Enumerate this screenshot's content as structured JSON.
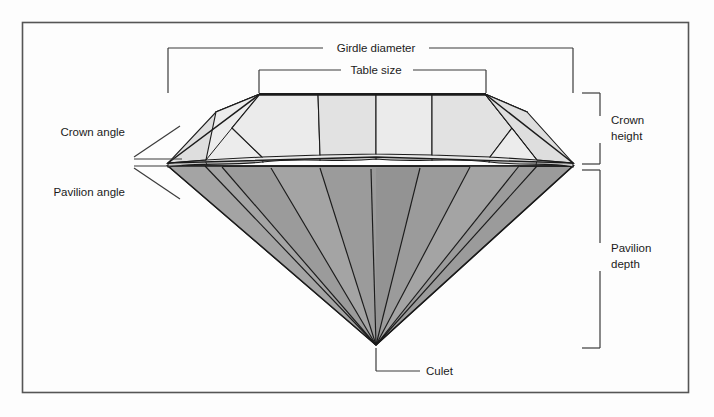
{
  "figure": {
    "border_color": "#555555",
    "background_color": "#fdfdfd",
    "line_color": "#1b1b1b",
    "crown_fill": "#e4e4e4",
    "crown_fill_alt": "#ededed",
    "pavilion_fill": "#9b9b9b",
    "pavilion_fill_alt": "#a5a5a5",
    "girdle_fill": "#c9c9c9"
  },
  "labels": {
    "girdle_diameter": "Girdle diameter",
    "table_size": "Table size",
    "crown_angle": "Crown angle",
    "pavilion_angle": "Pavilion angle",
    "crown_height_line1": "Crown",
    "crown_height_line2": "height",
    "pavilion_depth_line1": "Pavilion",
    "pavilion_depth_line2": "depth",
    "culet": "Culet"
  },
  "measurements": [
    {
      "name": "girdle-diameter",
      "label": "Girdle diameter",
      "orientation": "horizontal",
      "position": "top"
    },
    {
      "name": "table-size",
      "label": "Table size",
      "orientation": "horizontal",
      "position": "top"
    },
    {
      "name": "crown-height",
      "label": "Crown height",
      "orientation": "vertical",
      "position": "right"
    },
    {
      "name": "pavilion-depth",
      "label": "Pavilion depth",
      "orientation": "vertical",
      "position": "right"
    },
    {
      "name": "crown-angle",
      "label": "Crown angle",
      "orientation": "angle",
      "position": "left"
    },
    {
      "name": "pavilion-angle",
      "label": "Pavilion angle",
      "orientation": "angle",
      "position": "left"
    },
    {
      "name": "culet",
      "label": "Culet",
      "orientation": "point",
      "position": "bottom"
    }
  ]
}
